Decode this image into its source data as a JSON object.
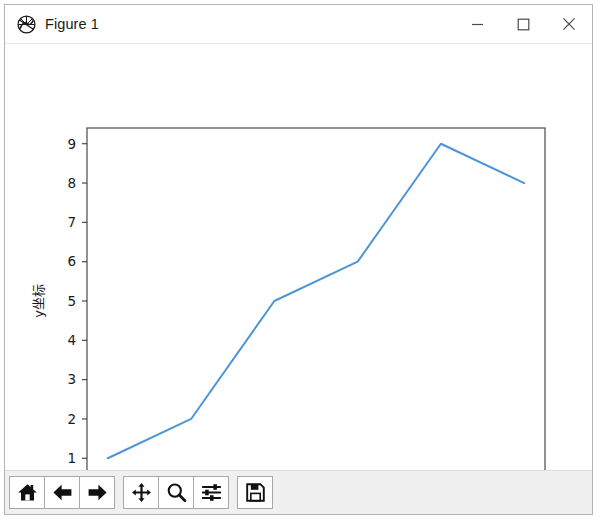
{
  "window": {
    "title": "Figure 1",
    "icon": "matplotlib-logo-icon",
    "controls": [
      {
        "name": "minimize-button",
        "glyph": "minimize-icon",
        "label": "—"
      },
      {
        "name": "maximize-button",
        "glyph": "maximize-icon",
        "label": "□"
      },
      {
        "name": "close-button",
        "glyph": "close-icon",
        "label": "✕"
      }
    ]
  },
  "toolbar": {
    "buttons": [
      {
        "name": "home-button",
        "icon": "home-icon",
        "tooltip": "Home"
      },
      {
        "name": "back-button",
        "icon": "arrow-left-icon",
        "tooltip": "Back"
      },
      {
        "name": "forward-button",
        "icon": "arrow-right-icon",
        "tooltip": "Forward"
      },
      {
        "name": "pan-button",
        "icon": "pan-move-icon",
        "tooltip": "Pan"
      },
      {
        "name": "zoom-button",
        "icon": "magnifier-icon",
        "tooltip": "Zoom"
      },
      {
        "name": "configure-subplots-button",
        "icon": "sliders-icon",
        "tooltip": "Configure subplots"
      },
      {
        "name": "save-button",
        "icon": "floppy-disk-icon",
        "tooltip": "Save"
      }
    ],
    "separator_after_index": 2
  },
  "chart_data": {
    "type": "line",
    "title": "",
    "xlabel": "x坐标",
    "ylabel": "y坐标",
    "x": [
      0,
      1,
      2,
      3,
      4,
      5
    ],
    "values": [
      1,
      2,
      5,
      6,
      9,
      8
    ],
    "series": [
      {
        "name": "",
        "values": [
          1,
          2,
          5,
          6,
          9,
          8
        ]
      }
    ],
    "xticks": [
      "0",
      "1",
      "2",
      "3",
      "4",
      "5"
    ],
    "yticks": [
      "1",
      "2",
      "3",
      "4",
      "5",
      "6",
      "7",
      "8",
      "9"
    ],
    "xlim": [
      -0.25,
      5.25
    ],
    "ylim": [
      0.6,
      9.4
    ],
    "grid": false,
    "legend": null,
    "line_color": "#4c95d6",
    "line_width": 2,
    "axes_color": "#3a3a3a",
    "tick_label_color": "#1a1a1a",
    "background": "#ffffff"
  }
}
